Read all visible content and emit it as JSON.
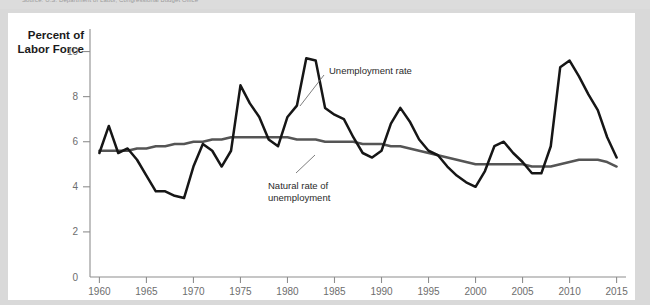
{
  "source_strip": {
    "text": "Source: U.S. Department of Labor, Congressional Budget Office"
  },
  "chart_data": {
    "type": "line",
    "title": "",
    "xlabel": "",
    "ylabel": "Percent of Labor Force",
    "ylabel_line1": "Percent of",
    "ylabel_line2": "Labor Force",
    "xlim": [
      1959,
      2016
    ],
    "ylim": [
      0,
      11
    ],
    "grid": false,
    "legend_position": "inline-annotations",
    "xticks": [
      1960,
      1965,
      1970,
      1975,
      1980,
      1985,
      1990,
      1995,
      2000,
      2005,
      2010,
      2015
    ],
    "xtick_labels": [
      "1960",
      "1965",
      "1970",
      "1975",
      "1980",
      "1985",
      "1990",
      "1995",
      "2000",
      "2005",
      "2010",
      "2015"
    ],
    "yticks": [
      0,
      2,
      4,
      6,
      8,
      10
    ],
    "ytick_labels": [
      "0",
      "2",
      "4",
      "6",
      "8",
      "10"
    ],
    "annotations": [
      {
        "name": "unemployment-rate",
        "text": "Unemployment rate",
        "text_line1": "Unemployment rate",
        "text_line2": ""
      },
      {
        "name": "natural-rate",
        "text": "Natural rate of unemployment",
        "text_line1": "Natural rate of",
        "text_line2": "unemployment"
      }
    ],
    "x": [
      1960,
      1961,
      1962,
      1963,
      1964,
      1965,
      1966,
      1967,
      1968,
      1969,
      1970,
      1971,
      1972,
      1973,
      1974,
      1975,
      1976,
      1977,
      1978,
      1979,
      1980,
      1981,
      1982,
      1983,
      1984,
      1985,
      1986,
      1987,
      1988,
      1989,
      1990,
      1991,
      1992,
      1993,
      1994,
      1995,
      1996,
      1997,
      1998,
      1999,
      2000,
      2001,
      2002,
      2003,
      2004,
      2005,
      2006,
      2007,
      2008,
      2009,
      2010,
      2011,
      2012,
      2013,
      2014,
      2015
    ],
    "series": [
      {
        "name": "Unemployment rate",
        "color": "#161616",
        "values": [
          5.5,
          6.7,
          5.5,
          5.7,
          5.2,
          4.5,
          3.8,
          3.8,
          3.6,
          3.5,
          4.9,
          5.9,
          5.6,
          4.9,
          5.6,
          8.5,
          7.7,
          7.1,
          6.1,
          5.8,
          7.1,
          7.6,
          9.7,
          9.6,
          7.5,
          7.2,
          7.0,
          6.2,
          5.5,
          5.3,
          5.6,
          6.8,
          7.5,
          6.9,
          6.1,
          5.6,
          5.4,
          4.9,
          4.5,
          4.2,
          4.0,
          4.7,
          5.8,
          6.0,
          5.5,
          5.1,
          4.6,
          4.6,
          5.8,
          9.3,
          9.6,
          8.9,
          8.1,
          7.4,
          6.2,
          5.3
        ]
      },
      {
        "name": "Natural rate of unemployment",
        "color": "#555555",
        "values": [
          5.6,
          5.6,
          5.6,
          5.6,
          5.7,
          5.7,
          5.8,
          5.8,
          5.9,
          5.9,
          6.0,
          6.0,
          6.1,
          6.1,
          6.2,
          6.2,
          6.2,
          6.2,
          6.2,
          6.2,
          6.2,
          6.1,
          6.1,
          6.1,
          6.0,
          6.0,
          6.0,
          6.0,
          5.9,
          5.9,
          5.9,
          5.8,
          5.8,
          5.7,
          5.6,
          5.5,
          5.4,
          5.3,
          5.2,
          5.1,
          5.0,
          5.0,
          5.0,
          5.0,
          5.0,
          5.0,
          4.9,
          4.9,
          4.9,
          5.0,
          5.1,
          5.2,
          5.2,
          5.2,
          5.1,
          4.9
        ]
      }
    ]
  }
}
